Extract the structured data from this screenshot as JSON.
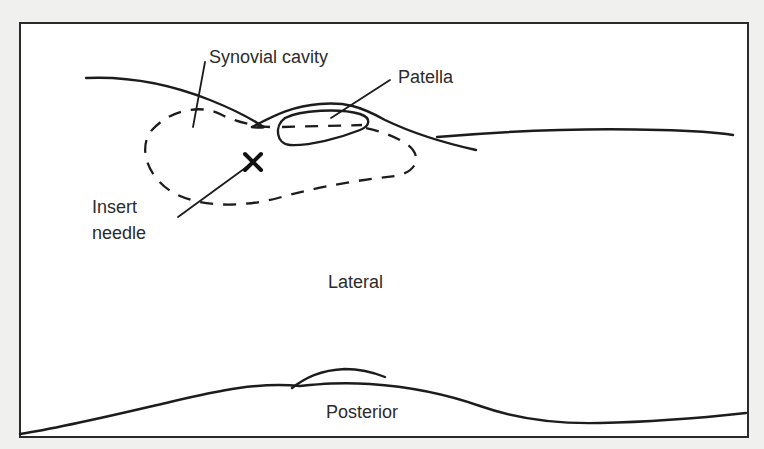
{
  "figure": {
    "labels": {
      "synovial_cavity": "Synovial cavity",
      "patella": "Patella",
      "insert_needle_line1": "Insert",
      "insert_needle_line2": "needle",
      "lateral": "Lateral",
      "posterior": "Posterior"
    },
    "markers": {
      "needle_site": "×"
    },
    "colors": {
      "background": "#f0f0ef",
      "frame_fill": "#ffffff",
      "ink": "#1c1c1c",
      "text": "#2b2b2b"
    }
  }
}
